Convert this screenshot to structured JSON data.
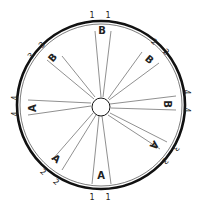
{
  "diagram": {
    "type": "wheel-with-spoke-pairs",
    "rim": {
      "cx": 101,
      "cy": 105,
      "r": 84,
      "outer_stroke": 2.6,
      "inner_r": 81,
      "inner_stroke": 0.7
    },
    "hub": {
      "cx": 101,
      "cy": 107,
      "r": 9
    },
    "colors": {
      "line": "#444444",
      "rim": "#111111",
      "text": "#222222",
      "background": "#ffffff"
    },
    "sectors": [
      {
        "id": "top",
        "label": "B",
        "label_pos": [
          102,
          31
        ],
        "label_rot": 0,
        "spokes": [
          [
            [
              101,
              97
            ],
            [
              95,
              31
            ]
          ],
          [
            [
              103,
              97
            ],
            [
              111,
              31
            ]
          ]
        ],
        "numbers": [
          {
            "text": "1",
            "pos": [
              92,
              15
            ],
            "rot": 0
          },
          {
            "text": "1",
            "pos": [
              108,
              15
            ],
            "rot": 0
          }
        ]
      },
      {
        "id": "upper-right",
        "label": "B",
        "label_pos": [
          149,
          60
        ],
        "label_rot": 40,
        "spokes": [
          [
            [
              108,
              99
            ],
            [
              142,
              52
            ]
          ],
          [
            [
              109,
              100
            ],
            [
              159,
              63
            ]
          ]
        ],
        "numbers": [
          {
            "text": "2",
            "pos": [
              154,
              42
            ],
            "rot": 40
          },
          {
            "text": "2",
            "pos": [
              166,
              52
            ],
            "rot": 40
          }
        ]
      },
      {
        "id": "right",
        "label": "B",
        "label_pos": [
          167,
          104
        ],
        "label_rot": 90,
        "spokes": [
          [
            [
              110,
              104
            ],
            [
              176,
              96
            ]
          ],
          [
            [
              111,
              108
            ],
            [
              176,
              110
            ]
          ]
        ],
        "numbers": [
          {
            "text": "4",
            "pos": [
              186,
              92
            ],
            "rot": 90
          },
          {
            "text": "4",
            "pos": [
              186,
              110
            ],
            "rot": 90
          }
        ]
      },
      {
        "id": "lower-right",
        "label": "A",
        "label_pos": [
          154,
          145
        ],
        "label_rot": 130,
        "spokes": [
          [
            [
              110,
              113
            ],
            [
              167,
              142
            ]
          ],
          [
            [
              108,
              115
            ],
            [
              160,
              149
            ]
          ]
        ],
        "numbers": [
          {
            "text": "3",
            "pos": [
              176,
              148
            ],
            "rot": 130
          },
          {
            "text": "3",
            "pos": [
              165,
              161
            ],
            "rot": 130
          }
        ]
      },
      {
        "id": "bottom",
        "label": "A",
        "label_pos": [
          101,
          176
        ],
        "label_rot": 0,
        "spokes": [
          [
            [
              99,
              116
            ],
            [
              92,
              184
            ]
          ],
          [
            [
              102,
              116
            ],
            [
              111,
              184
            ]
          ]
        ],
        "numbers": [
          {
            "text": "1",
            "pos": [
              92,
              197
            ],
            "rot": 0
          },
          {
            "text": "1",
            "pos": [
              108,
              197
            ],
            "rot": 0
          }
        ]
      },
      {
        "id": "lower-left",
        "label": "A",
        "label_pos": [
          56,
          159
        ],
        "label_rot": 40,
        "spokes": [
          [
            [
              93,
              113
            ],
            [
              52,
              160
            ]
          ],
          [
            [
              96,
              115
            ],
            [
              62,
              170
            ]
          ]
        ],
        "numbers": [
          {
            "text": "2",
            "pos": [
              43,
              172
            ],
            "rot": 40
          },
          {
            "text": "2",
            "pos": [
              56,
              182
            ],
            "rot": 40
          }
        ]
      },
      {
        "id": "left",
        "label": "A",
        "label_pos": [
          33,
          108
        ],
        "label_rot": -90,
        "spokes": [
          [
            [
              91,
              103
            ],
            [
              28,
              100
            ]
          ],
          [
            [
              91,
              106
            ],
            [
              28,
              115
            ]
          ]
        ],
        "numbers": [
          {
            "text": "4",
            "pos": [
              15,
              98
            ],
            "rot": -90
          },
          {
            "text": "4",
            "pos": [
              15,
              114
            ],
            "rot": -90
          }
        ]
      },
      {
        "id": "upper-left",
        "label": "B",
        "label_pos": [
          53,
          58
        ],
        "label_rot": -50,
        "spokes": [
          [
            [
              94,
              99
            ],
            [
              47,
              60
            ]
          ],
          [
            [
              95,
              97
            ],
            [
              62,
              56
            ]
          ]
        ],
        "numbers": [
          {
            "text": "3",
            "pos": [
              31,
              56
            ],
            "rot": -50
          },
          {
            "text": "3",
            "pos": [
              42,
              45
            ],
            "rot": -50
          }
        ]
      }
    ]
  }
}
